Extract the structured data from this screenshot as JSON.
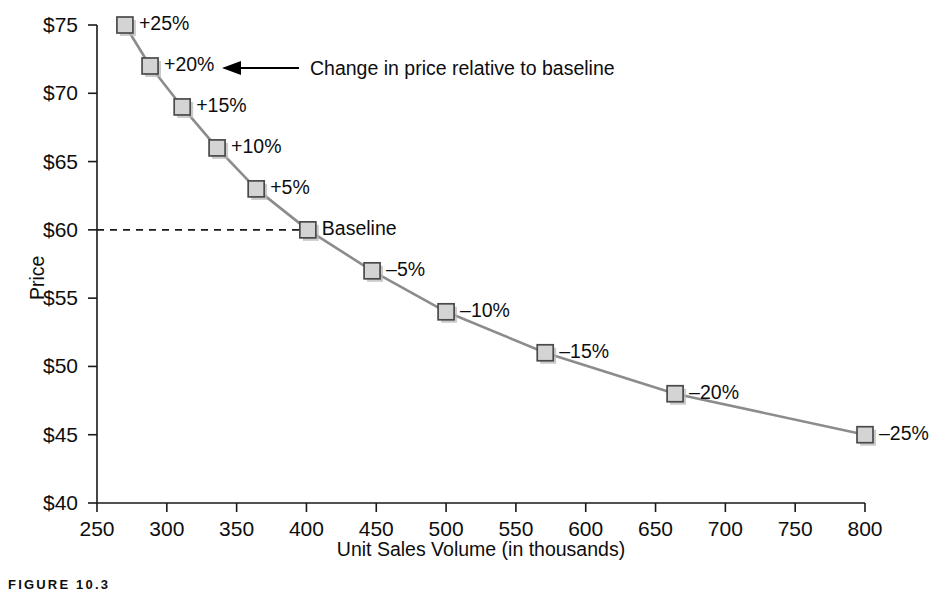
{
  "chart_data": {
    "type": "line",
    "title": "",
    "xlabel": "Unit Sales Volume (in thousands)",
    "ylabel": "Price",
    "xlim": [
      250,
      800
    ],
    "ylim": [
      40,
      75
    ],
    "grid": false,
    "legend": "none",
    "x_ticks": [
      "250",
      "300",
      "350",
      "400",
      "450",
      "500",
      "550",
      "600",
      "650",
      "700",
      "750",
      "800"
    ],
    "x_tick_values": [
      250,
      300,
      350,
      400,
      450,
      500,
      550,
      600,
      650,
      700,
      750,
      800
    ],
    "y_ticks": [
      "$40",
      "$45",
      "$50",
      "$55",
      "$60",
      "$65",
      "$70",
      "$75"
    ],
    "y_tick_values": [
      40,
      45,
      50,
      55,
      60,
      65,
      70,
      75
    ],
    "series": [
      {
        "name": "Price vs. Unit Sales Volume",
        "x": [
          270,
          288,
          311,
          336,
          364,
          401,
          447,
          500,
          571,
          664,
          800
        ],
        "y": [
          75,
          72,
          69,
          66,
          63,
          60,
          57,
          54,
          51,
          48,
          45
        ],
        "point_labels": [
          "+25%",
          "+20%",
          "+15%",
          "+10%",
          "+5%",
          "Baseline",
          "–5%",
          "–10%",
          "–15%",
          "–20%",
          "–25%"
        ]
      }
    ],
    "baseline": {
      "value": 60,
      "label": "Baseline",
      "x_at_baseline": 401,
      "style": "dashed"
    },
    "annotations": [
      {
        "text": "Change in price relative to baseline",
        "points_to": "+20%",
        "arrow": "left"
      }
    ]
  },
  "caption": {
    "text": "FIGURE 10.3"
  },
  "colors": {
    "line": "#8c8c8c",
    "marker_fill": "#d4d4d4",
    "marker_stroke": "#4a4a4a",
    "axis": "#1a1a1a",
    "background": "#ffffff"
  }
}
